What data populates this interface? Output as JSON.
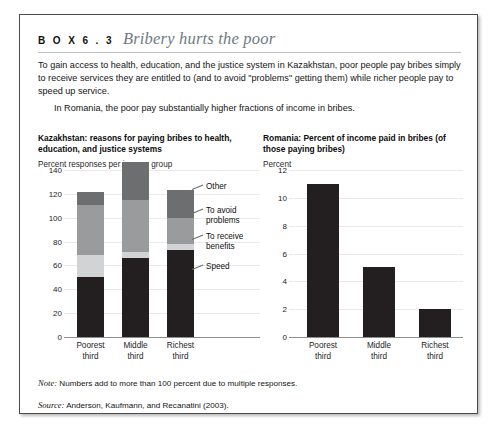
{
  "box": {
    "label": "B O X  6 . 3",
    "title": "Bribery hurts the poor"
  },
  "intro": {
    "paragraph1": "To gain access to health, education, and the justice system in Kazakhstan, poor people pay bribes simply to receive services they are entitled to (and to avoid \"problems\" getting them) while richer people pay to speed up service.",
    "paragraph2": "In Romania, the poor pay substantially higher fractions of income in bribes."
  },
  "footnotes": {
    "note_label": "Note:",
    "note_text": " Numbers add to more than 100 percent due to multiple responses.",
    "source_label": "Source:",
    "source_text": " Anderson, Kaufmann, and Recanatini (2003)."
  },
  "colors": {
    "speed": "#231f20",
    "to_receive_benefits": "#d2d3d4",
    "to_avoid_problems": "#9a9b9d",
    "other": "#6d6e70",
    "romania_bar": "#231f20",
    "gridline": "#e9e9e9",
    "axis": "#8e8e8e"
  },
  "chart_data": [
    {
      "type": "bar",
      "stacked": true,
      "title": "Kazakhstan: reasons for paying bribes to health, education, and justice systems",
      "ylabel": "Percent responses per income group",
      "xlabel": "",
      "categories": [
        "Poorest third",
        "Middle third",
        "Richest third"
      ],
      "ylim": [
        0,
        140
      ],
      "yticks": [
        0,
        20,
        40,
        60,
        80,
        100,
        120,
        140
      ],
      "ytick_labels": [
        "0",
        "20",
        "40",
        "60",
        "80",
        "100",
        "120",
        "140"
      ],
      "grid": true,
      "legend_position": "right",
      "series": [
        {
          "name": "Speed",
          "values": [
            50,
            66,
            73
          ]
        },
        {
          "name": "To receive benefits",
          "values": [
            19,
            5,
            5
          ]
        },
        {
          "name": "To avoid problems",
          "values": [
            42,
            44,
            22
          ]
        },
        {
          "name": "Other",
          "values": [
            11,
            32,
            23
          ]
        }
      ]
    },
    {
      "type": "bar",
      "stacked": false,
      "title": "Romania: Percent of income paid in bribes (of those paying bribes)",
      "ylabel": "Percent",
      "xlabel": "",
      "categories": [
        "Poorest third",
        "Middle third",
        "Richest third"
      ],
      "ylim": [
        0,
        12
      ],
      "yticks": [
        0,
        2,
        4,
        6,
        8,
        10,
        12
      ],
      "ytick_labels": [
        "0",
        "2",
        "4",
        "6",
        "8",
        "10",
        "12"
      ],
      "grid": true,
      "legend_position": "none",
      "values": [
        11,
        5,
        2
      ]
    }
  ]
}
